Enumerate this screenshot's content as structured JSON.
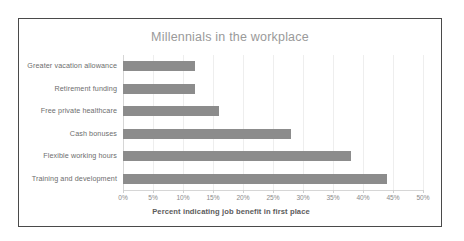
{
  "chart_data": {
    "type": "bar",
    "orientation": "horizontal",
    "title": "Millennials in the workplace",
    "xlabel": "Percent indicating job benefit in first place",
    "ylabel": "",
    "categories": [
      "Greater vacation allowance",
      "Retirement funding",
      "Free private healthcare",
      "Cash bonuses",
      "Flexible working hours",
      "Training and development"
    ],
    "values": [
      12,
      12,
      16,
      28,
      38,
      44
    ],
    "value_unit": "%",
    "xlim": [
      0,
      50
    ],
    "xticks": [
      0,
      5,
      10,
      15,
      20,
      25,
      30,
      35,
      40,
      45,
      50
    ],
    "xtick_labels": [
      "0%",
      "5%",
      "10%",
      "15%",
      "20%",
      "25%",
      "30%",
      "35%",
      "40%",
      "45%",
      "50%"
    ],
    "grid": true,
    "grid_axis": "x",
    "legend": false,
    "bar_color": "#8c8c8c",
    "title_color": "#9a9a9a",
    "gridline_color": "#eeeeee",
    "border_color": "#4a4a4a",
    "background_color": "#ffffff"
  }
}
